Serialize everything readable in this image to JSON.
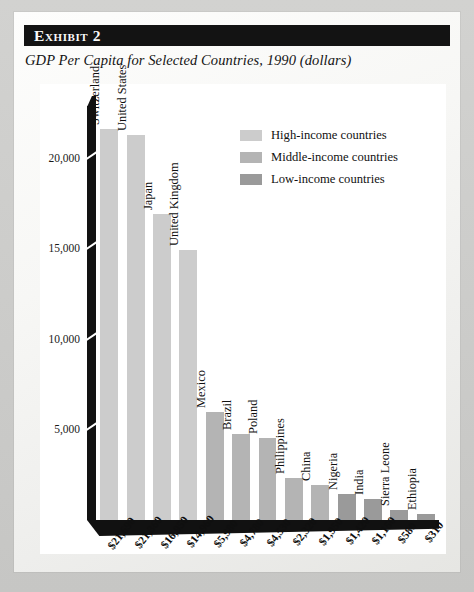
{
  "exhibit": {
    "label": "Exhibit 2",
    "subtitle": "GDP Per Capita for Selected Countries, 1990 (dollars)"
  },
  "colors": {
    "high_income": "#cccccc",
    "middle_income": "#b4b4b4",
    "low_income": "#9a9a9a",
    "axis": "#111111",
    "panel_background": "#ffffff",
    "header_bar": "#131313"
  },
  "legend": {
    "items": [
      {
        "label": "High-income countries",
        "color": "#cccccc"
      },
      {
        "label": "Middle-income countries",
        "color": "#b4b4b4"
      },
      {
        "label": "Low-income countries",
        "color": "#9a9a9a"
      }
    ]
  },
  "chart_data": {
    "type": "bar",
    "title": "GDP Per Capita for Selected Countries, 1990 (dollars)",
    "xlabel": "",
    "ylabel": "",
    "ylim": [
      0,
      23500
    ],
    "yticks": [
      5000,
      10000,
      15000,
      20000
    ],
    "ytick_labels": [
      "5,000",
      "10,000",
      "15,000",
      "20,000"
    ],
    "grid": false,
    "legend_position": "top-right",
    "categories": [
      "Switzerland",
      "United States",
      "Japan",
      "United Kingdom",
      "Mexico",
      "Brazil",
      "Poland",
      "Philippines",
      "China",
      "Nigeria",
      "India",
      "Sierra Leone",
      "Ethiopia"
    ],
    "values": [
      21690,
      21360,
      16950,
      14960,
      5980,
      4780,
      4530,
      2320,
      1950,
      1420,
      1150,
      580,
      310
    ],
    "value_labels": [
      "$21,690",
      "$21,360",
      "$16,950",
      "$14,960",
      "$5,980",
      "$4,780",
      "$4,530",
      "$2,320",
      "$1,950",
      "$1,420",
      "$1,150",
      "$580",
      "$310"
    ],
    "groups": [
      "high",
      "high",
      "high",
      "high",
      "middle",
      "middle",
      "middle",
      "middle",
      "middle",
      "low",
      "low",
      "low",
      "low"
    ]
  }
}
